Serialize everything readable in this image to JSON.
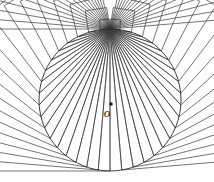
{
  "figure": {
    "background_color": "#ffffff",
    "stroke_color": "#3a3a3a",
    "circle_stroke_color": "#2a2a2a",
    "width": 214,
    "height": 182
  },
  "circle": {
    "name": "base-circle",
    "center_x": 110,
    "center_y": 100,
    "radius": 71,
    "stroke_width": 0.9
  },
  "apex": {
    "name": "convergence-point",
    "x": 110,
    "y": 29,
    "description": "top vertex where all chords meet"
  },
  "center_marker": {
    "name": "center-point-o",
    "label": "o",
    "label_x": 107,
    "label_y": 117,
    "dot_x": 111,
    "dot_y": 104,
    "dot_radius": 1.8
  },
  "squares": {
    "count": 37,
    "angle_start_deg": 4,
    "angle_end_deg": 176,
    "stroke_width": 0.7,
    "description": "each chord from apex to circle is one side of a square erected outward"
  },
  "chords": {
    "count": 37,
    "stroke_width": 0.65,
    "description": "radial lines from apex to points on the circle"
  },
  "caption": ""
}
